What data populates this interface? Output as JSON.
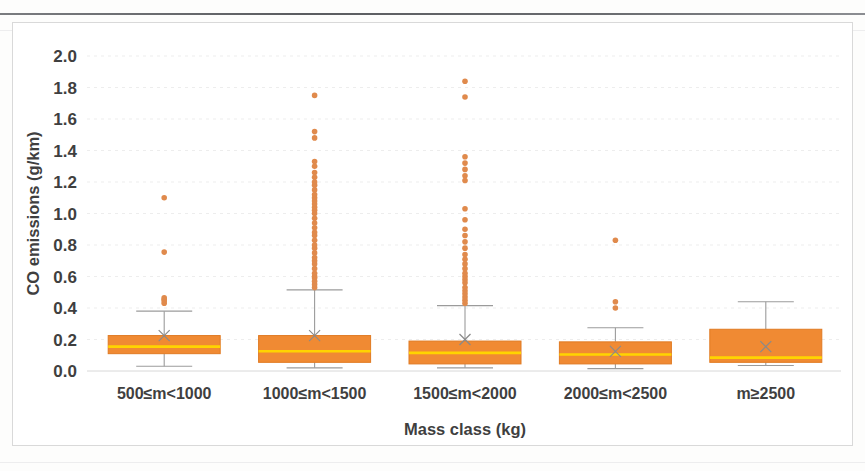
{
  "chart_data": {
    "type": "box",
    "title": "",
    "xlabel": "Mass class (kg)",
    "ylabel": "CO emissions (g/km)",
    "ylim": [
      0.0,
      2.0
    ],
    "yticks": [
      "0.0",
      "0.2",
      "0.4",
      "0.6",
      "0.8",
      "1.0",
      "1.2",
      "1.4",
      "1.6",
      "1.8",
      "2.0"
    ],
    "ytick_values": [
      0.0,
      0.2,
      0.4,
      0.6,
      0.8,
      1.0,
      1.2,
      1.4,
      1.6,
      1.8,
      2.0
    ],
    "grid": true,
    "legend": "none",
    "categories": [
      "500≤m<1000",
      "1000≤m<1500",
      "1500≤m<2000",
      "2000≤m<2500",
      "m≥2500"
    ],
    "series": [
      {
        "name": "500≤m<1000",
        "min": 0.03,
        "q1": 0.11,
        "median": 0.155,
        "mean": 0.225,
        "q3": 0.225,
        "max": 0.38,
        "outliers": [
          0.43,
          0.445,
          0.455,
          0.465,
          0.755,
          1.1
        ]
      },
      {
        "name": "1000≤m<1500",
        "min": 0.02,
        "q1": 0.055,
        "median": 0.125,
        "mean": 0.225,
        "q3": 0.225,
        "max": 0.515,
        "outliers": [
          0.53,
          0.55,
          0.57,
          0.59,
          0.6,
          0.62,
          0.65,
          0.68,
          0.7,
          0.72,
          0.75,
          0.78,
          0.8,
          0.83,
          0.86,
          0.88,
          0.91,
          0.94,
          0.97,
          1.0,
          1.02,
          1.04,
          1.06,
          1.08,
          1.1,
          1.12,
          1.15,
          1.18,
          1.2,
          1.23,
          1.26,
          1.3,
          1.33,
          1.48,
          1.52,
          1.75
        ]
      },
      {
        "name": "1500≤m<2000",
        "min": 0.02,
        "q1": 0.045,
        "median": 0.115,
        "mean": 0.2,
        "q3": 0.19,
        "max": 0.415,
        "outliers": [
          0.43,
          0.45,
          0.47,
          0.49,
          0.51,
          0.53,
          0.56,
          0.58,
          0.6,
          0.62,
          0.65,
          0.68,
          0.71,
          0.74,
          0.78,
          0.82,
          0.86,
          0.9,
          0.96,
          1.03,
          1.21,
          1.24,
          1.28,
          1.32,
          1.36,
          1.74,
          1.84
        ]
      },
      {
        "name": "2000≤m<2500",
        "min": 0.015,
        "q1": 0.045,
        "median": 0.105,
        "mean": 0.125,
        "q3": 0.185,
        "max": 0.275,
        "outliers": [
          0.4,
          0.44,
          0.83
        ]
      },
      {
        "name": "m≥2500",
        "min": 0.035,
        "q1": 0.055,
        "median": 0.085,
        "mean": 0.155,
        "q3": 0.265,
        "max": 0.44,
        "outliers": []
      }
    ],
    "colors": {
      "box_fill": "#F08A33",
      "box_edge": "#E07A22",
      "median_line": "#FFD400",
      "whisker": "#9B9B9B",
      "outlier": "#E08A4C",
      "grid": "#EDEDED",
      "text": "#3F3F3F"
    }
  }
}
